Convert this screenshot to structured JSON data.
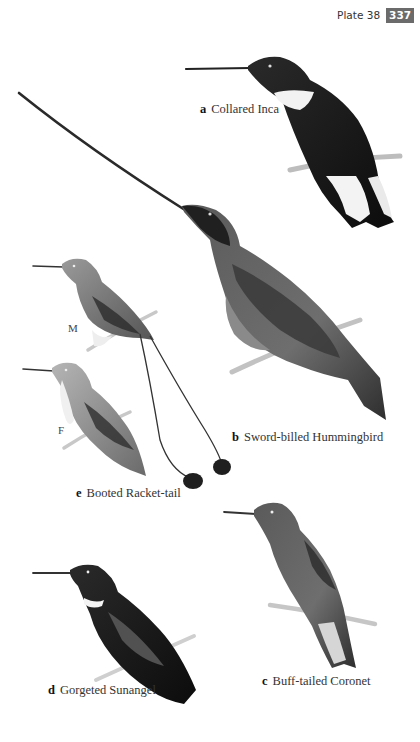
{
  "header": {
    "plate_label": "Plate 38",
    "page_number": "337",
    "badge_color": "#6b6b6b"
  },
  "species": [
    {
      "letter": "a",
      "name": "Collared Inca"
    },
    {
      "letter": "b",
      "name": "Sword-billed Hummingbird"
    },
    {
      "letter": "c",
      "name": "Buff-tailed Coronet"
    },
    {
      "letter": "d",
      "name": "Gorgeted Sunangel"
    },
    {
      "letter": "e",
      "name": "Booted Racket-tail"
    }
  ],
  "sex_labels": {
    "male": "M",
    "female": "F"
  }
}
